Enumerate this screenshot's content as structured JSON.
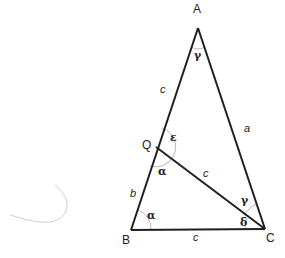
{
  "diagram": {
    "title": "",
    "colors": {
      "line": "#1f1f1f",
      "arc": "#b8b8b8",
      "text": "#222222",
      "stray_curve": "#cfcfcf"
    },
    "vertices": {
      "A": {
        "label": "A",
        "x": 198,
        "y": 28
      },
      "B": {
        "label": "B",
        "x": 131,
        "y": 230
      },
      "C": {
        "label": "C",
        "x": 265,
        "y": 229
      },
      "Q": {
        "label": "Q",
        "x": 156,
        "y": 147
      }
    },
    "sides": {
      "AQ": "c",
      "AC": "a",
      "QB": "b",
      "QC": "c",
      "BC": "c"
    },
    "angles": {
      "A": "γ",
      "Q_upper": "ε",
      "Q_lower": "α",
      "B": "α",
      "C_upper": "γ",
      "C_lower": "δ"
    }
  }
}
